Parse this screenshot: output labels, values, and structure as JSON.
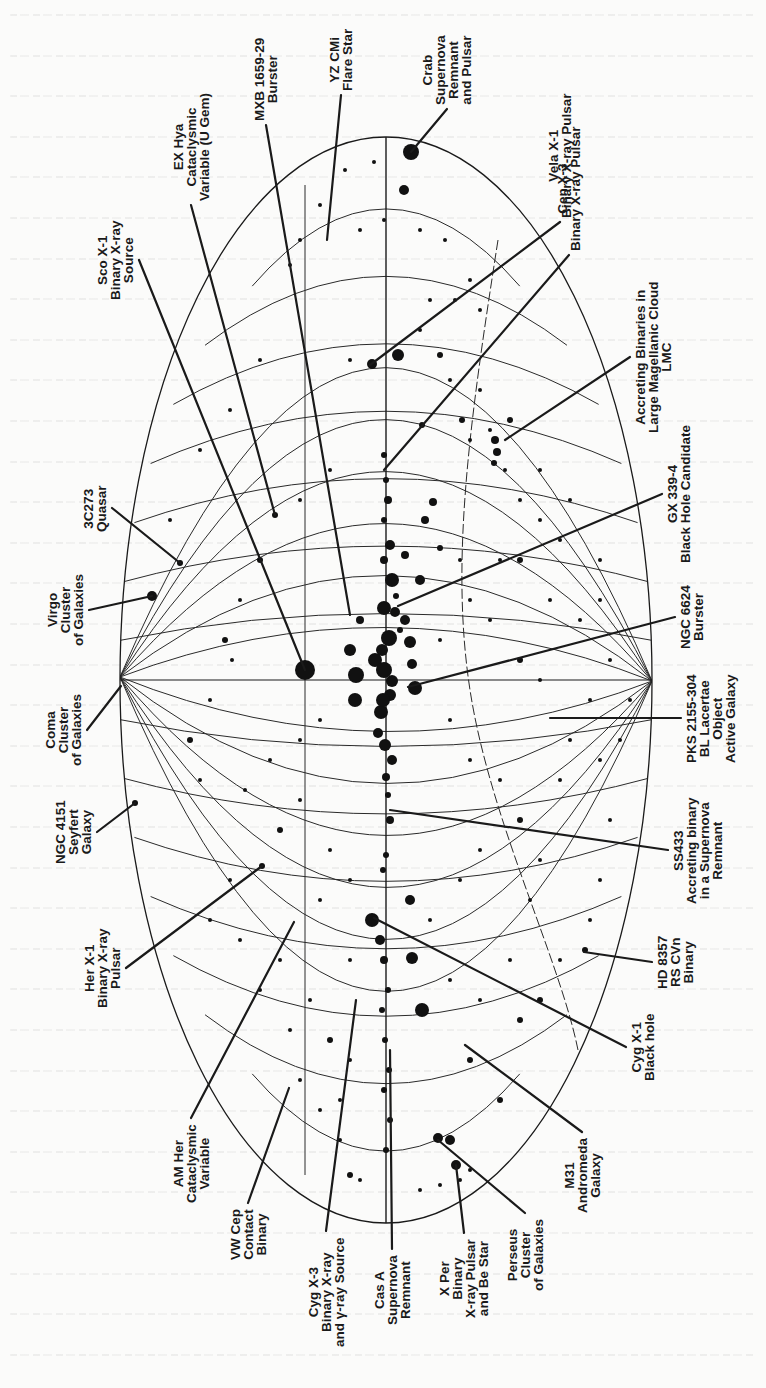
{
  "figure": {
    "type": "Aitoff all-sky map of X-ray sources in galactic coordinates (rotated 90°)",
    "orientation": "labels rotated -90deg (read bottom-to-top)",
    "ink_color": "#1a1a1a",
    "paper_color": "#fbfbfa",
    "geometry": {
      "center": [
        386,
        680
      ],
      "semi_axis_x": 266,
      "semi_axis_y": 543,
      "left_pole": [
        120,
        677
      ],
      "right_pole": [
        652,
        681
      ]
    }
  },
  "labels": [
    {
      "id": "crab",
      "lines": [
        "Crab",
        "Supernova",
        "Remnant",
        "and Pulsar"
      ],
      "anchor": [
        447,
        109
      ],
      "target": [
        411,
        152
      ]
    },
    {
      "id": "yz-cmi",
      "lines": [
        "YZ CMi",
        "Flare Star"
      ],
      "anchor": [
        341,
        95
      ],
      "target": [
        327,
        240
      ]
    },
    {
      "id": "mxb-1659-29",
      "lines": [
        "MXB 1659-29",
        "Burster"
      ],
      "anchor": [
        266,
        125
      ],
      "target": [
        350,
        615
      ]
    },
    {
      "id": "ex-hya",
      "lines": [
        "EX Hya",
        "Cataclysmic",
        "Variable (U Gem)"
      ],
      "anchor": [
        191,
        205
      ],
      "target": [
        275,
        515
      ]
    },
    {
      "id": "sco-x1",
      "lines": [
        "Sco X-1",
        "Binary X-ray",
        "Source"
      ],
      "anchor": [
        139,
        260
      ],
      "target": [
        305,
        670
      ]
    },
    {
      "id": "vela-x1",
      "lines": [
        "Vela X-1",
        "Binary X-ray Pulsar"
      ],
      "anchor": [
        560,
        222
      ],
      "target": [
        370,
        365
      ]
    },
    {
      "id": "cen-x3",
      "lines": [
        "Cen X-3",
        "Binary X-ray Pulsar"
      ],
      "anchor": [
        569,
        255
      ],
      "target": [
        384,
        470
      ]
    },
    {
      "id": "lmc",
      "lines": [
        "Accreting Binaries in",
        "Large Magellanic Cloud",
        "LMC"
      ],
      "anchor": [
        630,
        357
      ],
      "target": [
        505,
        440
      ]
    },
    {
      "id": "gx-339-4",
      "lines": [
        "GX 339-4",
        "Black Hole Candidate"
      ],
      "anchor": [
        662,
        494
      ],
      "target": [
        398,
        606
      ]
    },
    {
      "id": "ngc-6624",
      "lines": [
        "NGC 6624",
        "Burster"
      ],
      "anchor": [
        675,
        617
      ],
      "target": [
        408,
        687
      ]
    },
    {
      "id": "pks-2155-304",
      "lines": [
        "PKS 2155-304",
        "BL Lacertae",
        "Object",
        "Active Galaxy"
      ],
      "anchor": [
        681,
        718
      ],
      "target": [
        550,
        718
      ]
    },
    {
      "id": "ss433",
      "lines": [
        "SS433",
        "Accreting binary",
        "in a Supernova",
        "Remnant"
      ],
      "anchor": [
        668,
        850
      ],
      "target": [
        390,
        810
      ]
    },
    {
      "id": "hd-8357",
      "lines": [
        "HD 8357",
        "RS CVn",
        "Binary"
      ],
      "anchor": [
        652,
        962
      ],
      "target": [
        584,
        952
      ]
    },
    {
      "id": "cyg-x1",
      "lines": [
        "Cyg X-1",
        "Black hole"
      ],
      "anchor": [
        626,
        1047
      ],
      "target": [
        374,
        918
      ]
    },
    {
      "id": "m31",
      "lines": [
        "M31",
        "Andromeda",
        "Galaxy"
      ],
      "anchor": [
        582,
        1132
      ],
      "target": [
        465,
        1045
      ]
    },
    {
      "id": "perseus",
      "lines": [
        "Perseus",
        "Cluster",
        "of Galaxies"
      ],
      "anchor": [
        525,
        1213
      ],
      "target": [
        438,
        1140
      ]
    },
    {
      "id": "x-per",
      "lines": [
        "X Per",
        "Binary",
        "X-ray Pulsar",
        "and Be Star"
      ],
      "anchor": [
        464,
        1233
      ],
      "target": [
        456,
        1165
      ]
    },
    {
      "id": "cas-a",
      "lines": [
        "Cas A",
        "Supernova",
        "Remnant"
      ],
      "anchor": [
        392,
        1249
      ],
      "target": [
        390,
        1050
      ]
    },
    {
      "id": "cyg-x3",
      "lines": [
        "Cyg X-3",
        "Binary X-ray",
        "and γ-ray Source"
      ],
      "anchor": [
        326,
        1231
      ],
      "target": [
        356,
        1000
      ]
    },
    {
      "id": "vw-cep",
      "lines": [
        "VW Cep",
        "Contact",
        "Binary"
      ],
      "anchor": [
        248,
        1203
      ],
      "target": [
        289,
        1088
      ]
    },
    {
      "id": "am-her",
      "lines": [
        "AM Her",
        "Cataclysmic",
        "Variable"
      ],
      "anchor": [
        191,
        1118
      ],
      "target": [
        294,
        922
      ]
    },
    {
      "id": "her-x1",
      "lines": [
        "Her X-1",
        "Binary X-ray",
        "Pulsar"
      ],
      "anchor": [
        126,
        968
      ],
      "target": [
        262,
        866
      ]
    },
    {
      "id": "ngc-4151",
      "lines": [
        "NGC 4151",
        "Seyfert",
        "Galaxy"
      ],
      "anchor": [
        97,
        832
      ],
      "target": [
        135,
        803
      ]
    },
    {
      "id": "coma",
      "lines": [
        "Coma",
        "Cluster",
        "of Galaxies"
      ],
      "anchor": [
        87,
        730
      ],
      "target": [
        121,
        686
      ]
    },
    {
      "id": "virgo",
      "lines": [
        "Virgo",
        "Cluster",
        "of Galaxies"
      ],
      "anchor": [
        89,
        610
      ],
      "target": [
        152,
        596
      ]
    },
    {
      "id": "3c273",
      "lines": [
        "3C273",
        "Quasar"
      ],
      "anchor": [
        112,
        508
      ],
      "target": [
        180,
        563
      ]
    }
  ],
  "ghost_text_lines": 34,
  "stars": [
    [
      411,
      152,
      8
    ],
    [
      404,
      190,
      5
    ],
    [
      374,
      162,
      2
    ],
    [
      345,
      170,
      2
    ],
    [
      384,
      220,
      2
    ],
    [
      360,
      230,
      2
    ],
    [
      320,
      205,
      2
    ],
    [
      300,
      240,
      2
    ],
    [
      290,
      265,
      2
    ],
    [
      420,
      230,
      2
    ],
    [
      445,
      240,
      2
    ],
    [
      470,
      280,
      2
    ],
    [
      480,
      310,
      2
    ],
    [
      398,
      355,
      6
    ],
    [
      372,
      364,
      5
    ],
    [
      350,
      360,
      2
    ],
    [
      420,
      330,
      2
    ],
    [
      440,
      355,
      3
    ],
    [
      462,
      420,
      3
    ],
    [
      470,
      440,
      2
    ],
    [
      490,
      430,
      2
    ],
    [
      495,
      440,
      4
    ],
    [
      497,
      452,
      4
    ],
    [
      494,
      463,
      3
    ],
    [
      505,
      470,
      2
    ],
    [
      520,
      500,
      2
    ],
    [
      540,
      520,
      2
    ],
    [
      560,
      540,
      2
    ],
    [
      600,
      600,
      2
    ],
    [
      610,
      660,
      2
    ],
    [
      384,
      455,
      3
    ],
    [
      386,
      480,
      3
    ],
    [
      388,
      500,
      4
    ],
    [
      384,
      520,
      3
    ],
    [
      390,
      545,
      5
    ],
    [
      384,
      560,
      4
    ],
    [
      392,
      580,
      7
    ],
    [
      396,
      596,
      3
    ],
    [
      384,
      608,
      7
    ],
    [
      400,
      630,
      3
    ],
    [
      389,
      638,
      8
    ],
    [
      382,
      650,
      6
    ],
    [
      375,
      660,
      7
    ],
    [
      384,
      670,
      8
    ],
    [
      392,
      681,
      6
    ],
    [
      390,
      695,
      6
    ],
    [
      381,
      712,
      7
    ],
    [
      378,
      733,
      5
    ],
    [
      385,
      745,
      6
    ],
    [
      392,
      760,
      5
    ],
    [
      386,
      777,
      4
    ],
    [
      388,
      795,
      3
    ],
    [
      390,
      820,
      4
    ],
    [
      386,
      855,
      3
    ],
    [
      383,
      870,
      3
    ],
    [
      372,
      920,
      7
    ],
    [
      380,
      940,
      5
    ],
    [
      384,
      960,
      4
    ],
    [
      388,
      990,
      3
    ],
    [
      382,
      1010,
      3
    ],
    [
      385,
      1040,
      3
    ],
    [
      389,
      1070,
      3
    ],
    [
      384,
      1090,
      3
    ],
    [
      390,
      1120,
      3
    ],
    [
      386,
      1150,
      3
    ],
    [
      305,
      670,
      10
    ],
    [
      356,
      675,
      8
    ],
    [
      355,
      700,
      7
    ],
    [
      383,
      700,
      7
    ],
    [
      350,
      650,
      6
    ],
    [
      415,
      688,
      7
    ],
    [
      410,
      642,
      6
    ],
    [
      405,
      620,
      5
    ],
    [
      395,
      612,
      5
    ],
    [
      412,
      664,
      5
    ],
    [
      360,
      620,
      4
    ],
    [
      420,
      580,
      5
    ],
    [
      425,
      520,
      4
    ],
    [
      433,
      502,
      4
    ],
    [
      405,
      555,
      4
    ],
    [
      440,
      548,
      3
    ],
    [
      422,
      425,
      3
    ],
    [
      412,
      958,
      6
    ],
    [
      422,
      1010,
      7
    ],
    [
      410,
      900,
      5
    ],
    [
      450,
      1140,
      5
    ],
    [
      438,
      1138,
      5
    ],
    [
      456,
      1165,
      5
    ],
    [
      470,
      1060,
      3
    ],
    [
      500,
      1100,
      3
    ],
    [
      520,
      1020,
      3
    ],
    [
      540,
      1000,
      3
    ],
    [
      560,
      960,
      2
    ],
    [
      590,
      920,
      2
    ],
    [
      600,
      880,
      2
    ],
    [
      585,
      950,
      3
    ],
    [
      152,
      596,
      5
    ],
    [
      135,
      803,
      3
    ],
    [
      180,
      563,
      3
    ],
    [
      170,
      520,
      2
    ],
    [
      200,
      450,
      2
    ],
    [
      230,
      410,
      2
    ],
    [
      260,
      360,
      2
    ],
    [
      262,
      866,
      3
    ],
    [
      230,
      880,
      2
    ],
    [
      210,
      920,
      2
    ],
    [
      240,
      940,
      2
    ],
    [
      260,
      990,
      2
    ],
    [
      290,
      1030,
      2
    ],
    [
      300,
      1080,
      2
    ],
    [
      320,
      1110,
      2
    ],
    [
      340,
      1140,
      2
    ],
    [
      360,
      1180,
      2
    ],
    [
      420,
      1190,
      2
    ],
    [
      440,
      1185,
      2
    ],
    [
      460,
      1180,
      2
    ],
    [
      470,
      1170,
      2
    ],
    [
      350,
      1175,
      3
    ],
    [
      275,
      515,
      3
    ],
    [
      300,
      500,
      2
    ],
    [
      330,
      470,
      2
    ],
    [
      260,
      560,
      3
    ],
    [
      240,
      600,
      2
    ],
    [
      225,
      640,
      3
    ],
    [
      232,
      660,
      2
    ],
    [
      210,
      700,
      2
    ],
    [
      190,
      740,
      3
    ],
    [
      200,
      780,
      2
    ],
    [
      245,
      790,
      2
    ],
    [
      270,
      760,
      2
    ],
    [
      300,
      740,
      2
    ],
    [
      320,
      720,
      2
    ],
    [
      300,
      800,
      2
    ],
    [
      280,
      830,
      3
    ],
    [
      330,
      850,
      2
    ],
    [
      350,
      880,
      2
    ],
    [
      320,
      900,
      2
    ],
    [
      280,
      960,
      2
    ],
    [
      350,
      960,
      2
    ],
    [
      310,
      1000,
      2
    ],
    [
      330,
      1040,
      3
    ],
    [
      350,
      1060,
      2
    ],
    [
      340,
      1100,
      2
    ],
    [
      440,
      640,
      2
    ],
    [
      450,
      720,
      2
    ],
    [
      470,
      760,
      2
    ],
    [
      500,
      780,
      2
    ],
    [
      520,
      820,
      3
    ],
    [
      540,
      860,
      2
    ],
    [
      480,
      850,
      2
    ],
    [
      460,
      880,
      2
    ],
    [
      430,
      920,
      2
    ],
    [
      450,
      980,
      2
    ],
    [
      480,
      1000,
      2
    ],
    [
      510,
      960,
      2
    ],
    [
      530,
      900,
      2
    ],
    [
      560,
      780,
      2
    ],
    [
      570,
      740,
      2
    ],
    [
      590,
      700,
      2
    ],
    [
      600,
      760,
      2
    ],
    [
      610,
      820,
      2
    ],
    [
      620,
      740,
      2
    ],
    [
      630,
      700,
      2
    ],
    [
      540,
      680,
      2
    ],
    [
      520,
      660,
      3
    ],
    [
      490,
      620,
      2
    ],
    [
      470,
      600,
      2
    ],
    [
      500,
      560,
      2
    ],
    [
      460,
      560,
      2
    ],
    [
      520,
      560,
      3
    ],
    [
      550,
      600,
      2
    ],
    [
      580,
      620,
      2
    ],
    [
      600,
      560,
      2
    ],
    [
      570,
      500,
      2
    ],
    [
      540,
      470,
      2
    ],
    [
      510,
      420,
      3
    ],
    [
      480,
      390,
      2
    ],
    [
      450,
      380,
      2
    ],
    [
      430,
      300,
      2
    ],
    [
      455,
      300,
      2
    ]
  ]
}
